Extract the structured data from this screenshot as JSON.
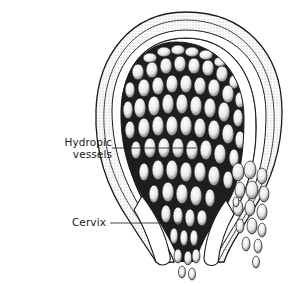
{
  "figure": {
    "labels": [
      {
        "id": "hydropic",
        "line1": "Hydropic",
        "line2": "vessels"
      },
      {
        "id": "cervix",
        "line1": "Cervix"
      }
    ]
  },
  "colors": {
    "ink": "#1a1a1a",
    "background": "#ffffff",
    "vesicle_fill": "#f4f4f4",
    "wall_fill": "#ffffff"
  }
}
